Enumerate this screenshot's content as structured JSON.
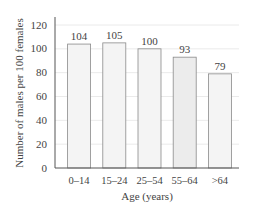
{
  "chart_data": {
    "type": "bar",
    "title": "",
    "xlabel": "Age (years)",
    "ylabel": "Number of males per 100 females",
    "categories": [
      "0–14",
      "15–24",
      "25–54",
      "55–64",
      ">64"
    ],
    "values": [
      104,
      105,
      100,
      93,
      79
    ],
    "data_labels": [
      "104",
      "105",
      "100",
      "93",
      "79"
    ],
    "ylim": [
      0,
      120
    ],
    "yticks": [
      0,
      20,
      40,
      60,
      80,
      100,
      120
    ],
    "grid": true,
    "legend": null,
    "colors": {
      "bar_fill": "#f4f4f4",
      "bar_fill_dark": "#ececec",
      "bar_stroke": "#8a8a8a",
      "grid": "#e4e4e4",
      "axis": "#555555",
      "text": "#444444"
    }
  }
}
